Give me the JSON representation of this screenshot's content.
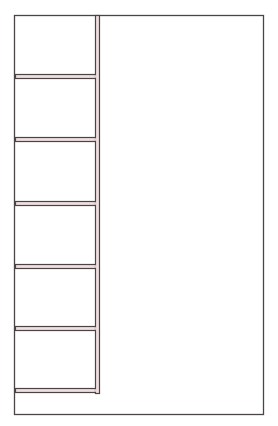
{
  "diagram": {
    "type": "shelving-unit-line-drawing",
    "canvas": {
      "width": 278,
      "height": 426
    },
    "colors": {
      "line": "#4a4446",
      "board_fill": "#f1dfe0",
      "background": "#ffffff"
    },
    "outer_frame": {
      "x": 14,
      "y": 15,
      "width": 249,
      "height": 399
    },
    "post": {
      "x": 95,
      "y": 15,
      "width": 5,
      "bottom": 393
    },
    "shelves": [
      {
        "y": 74,
        "thickness": 5
      },
      {
        "y": 137,
        "thickness": 5
      },
      {
        "y": 201,
        "thickness": 5
      },
      {
        "y": 264,
        "thickness": 5
      },
      {
        "y": 326,
        "thickness": 5
      },
      {
        "y": 388,
        "thickness": 5
      }
    ],
    "shelf_left": 15,
    "shelf_right": 95,
    "compartment_count": 6
  }
}
